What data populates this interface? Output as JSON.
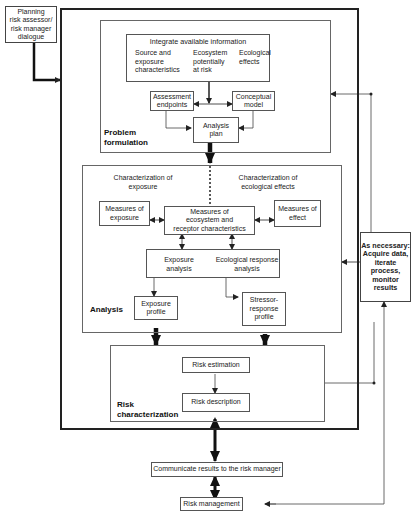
{
  "diagram": {
    "planning_box": {
      "lines": [
        "Planning",
        "risk assessor/",
        "risk manager",
        "dialogue"
      ]
    },
    "problem_formulation": {
      "label_1": "Problem",
      "label_2": "formulation",
      "integrate": {
        "title": "Integrate available information",
        "col1": [
          "Source and",
          "exposure",
          "characteristics"
        ],
        "col2": [
          "Ecosystem",
          "potentially",
          "at risk"
        ],
        "col3": [
          "Ecological",
          "effects"
        ]
      },
      "assessment_endpoints": [
        "Assessment",
        "endpoints"
      ],
      "conceptual_model": [
        "Conceptual",
        "model"
      ],
      "analysis_plan": [
        "Analysis",
        "plan"
      ]
    },
    "analysis": {
      "label": "Analysis",
      "char_exposure": [
        "Characterization of",
        "exposure"
      ],
      "char_effects": [
        "Characterization of",
        "ecological effects"
      ],
      "measures_exposure": [
        "Measures of",
        "exposure"
      ],
      "measures_ecosystem": [
        "Measures of",
        "ecosystem and",
        "receptor characteristics"
      ],
      "measures_effect": [
        "Measures of",
        "effect"
      ],
      "exposure_analysis": [
        "Exposure",
        "analysis"
      ],
      "ecological_response_analysis": [
        "Ecological response",
        "analysis"
      ],
      "exposure_profile": [
        "Exposure",
        "profile"
      ],
      "stressor_response_profile": [
        "Stressor-",
        "response",
        "profile"
      ]
    },
    "risk_characterization": {
      "label_1": "Risk",
      "label_2": "characterization",
      "risk_estimation": "Risk estimation",
      "risk_description": "Risk description"
    },
    "as_necessary": {
      "lines": [
        "As necessary:",
        "Acquire data,",
        "iterate",
        "process,",
        "monitor results"
      ]
    },
    "communicate": "Communicate results to the risk manager",
    "risk_management": "Risk management"
  }
}
